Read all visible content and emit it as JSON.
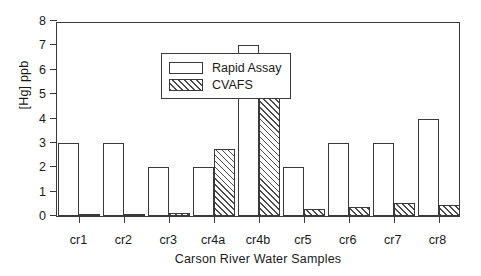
{
  "chart_data": {
    "type": "bar",
    "title": "",
    "xlabel": "Carson River Water Samples",
    "ylabel": "[Hg] ppb",
    "categories": [
      "cr1",
      "cr2",
      "cr3",
      "cr4a",
      "cr4b",
      "cr5",
      "cr6",
      "cr7",
      "cr8"
    ],
    "series": [
      {
        "name": "Rapid Assay",
        "style": "open",
        "color": "#ffffff",
        "values": [
          3,
          3,
          2,
          2,
          7,
          2,
          3,
          3,
          4
        ]
      },
      {
        "name": "CVAFS",
        "style": "diagonal-hatch",
        "color": "#4a4a4a",
        "values": [
          0.03,
          0.05,
          0.12,
          2.75,
          5.45,
          0.27,
          0.38,
          0.52,
          0.45
        ]
      }
    ],
    "ylim": [
      0,
      8
    ],
    "yticks": [
      0,
      1,
      2,
      3,
      4,
      5,
      6,
      7,
      8
    ],
    "ytick_labels": [
      "0",
      "1",
      "2",
      "3",
      "4",
      "5",
      "6",
      "7",
      "8"
    ],
    "grid": false,
    "legend_position": "upper-left-inside",
    "axis_frame": "box",
    "line_color": "#3a3a3a"
  }
}
